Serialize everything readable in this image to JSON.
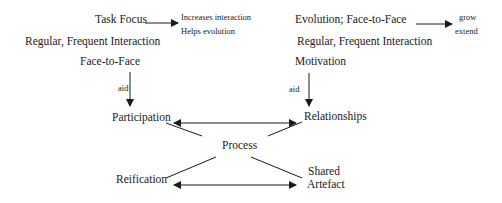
{
  "diagram": {
    "left_column": {
      "task_focus": "Task Focus",
      "task_focus_effects": [
        "Increases interaction",
        "Helps evolution"
      ],
      "regular_interaction": "Regular, Frequent Interaction",
      "face_to_face": "Face-to-Face",
      "aid_label": "aid",
      "target": "Participation"
    },
    "right_column": {
      "evolution": "Evolution; Face-to-Face",
      "evolution_effects": [
        "grow",
        "extend"
      ],
      "regular_interaction": "Regular, Frequent Interaction",
      "motivation": "Motivation",
      "aid_label": "aid",
      "target": "Relationships"
    },
    "center": {
      "process": "Process"
    },
    "bottom": {
      "reification": "Reification",
      "shared_artefact": [
        "Shared",
        "Artefact"
      ]
    },
    "edges": [
      {
        "from": "Task Focus",
        "to": "Increases interaction / Helps evolution",
        "type": "arrow"
      },
      {
        "from": "Evolution; Face-to-Face",
        "to": "grow / extend",
        "type": "arrow"
      },
      {
        "from": "Face-to-Face",
        "to": "Participation",
        "label": "aid",
        "type": "arrow"
      },
      {
        "from": "Motivation",
        "to": "Relationships",
        "label": "aid",
        "type": "arrow"
      },
      {
        "from": "Participation",
        "to": "Relationships",
        "type": "double-arrow"
      },
      {
        "from": "Reification",
        "to": "Shared Artefact",
        "type": "double-arrow"
      },
      {
        "from": "Participation",
        "to": "Process",
        "type": "line"
      },
      {
        "from": "Relationships",
        "to": "Process",
        "type": "line"
      },
      {
        "from": "Reification",
        "to": "Process",
        "type": "line"
      },
      {
        "from": "Shared Artefact",
        "to": "Process",
        "type": "line"
      }
    ],
    "colors": {
      "ink": "#1a1a1a",
      "background": "#ffffff"
    }
  }
}
